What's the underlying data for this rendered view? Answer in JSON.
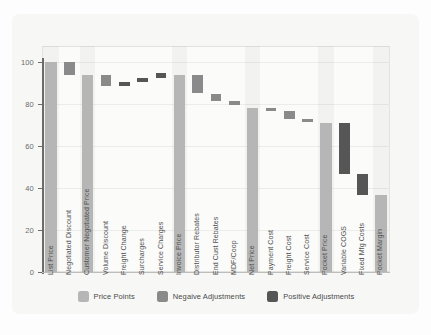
{
  "chart_data": {
    "type": "bar",
    "chart_subtype": "waterfall",
    "title": "",
    "xlabel": "",
    "ylabel": "",
    "ylim": [
      0,
      100
    ],
    "yticks": [
      0,
      20,
      40,
      60,
      80,
      100
    ],
    "grid": true,
    "legend_position": "bottom-center",
    "categories": [
      "List Price",
      "Negotiated Discount",
      "Customer Negotiated Price",
      "Volume Discount",
      "Freight Change",
      "Surcharges",
      "Service Charges",
      "Invoice Price",
      "Distributor Rebates",
      "End Cust Rebates",
      "MDF/Coop",
      "Net Price",
      "Payment Cost",
      "Freight Cost",
      "Service Cost",
      "Pocket Price",
      "Variable COGS",
      "Fixed Mfg Costs",
      "Pocket Margin"
    ],
    "bars": [
      {
        "label": "List Price",
        "kind": "total",
        "base": 0,
        "top": 100.0
      },
      {
        "label": "Negotiated Discount",
        "kind": "neg",
        "base": 94.0,
        "top": 100.0
      },
      {
        "label": "Customer Negotiated Price",
        "kind": "total",
        "base": 0,
        "top": 94.0
      },
      {
        "label": "Volume Discount",
        "kind": "neg",
        "base": 88.5,
        "top": 94.0
      },
      {
        "label": "Freight Change",
        "kind": "pos",
        "base": 88.5,
        "top": 90.5
      },
      {
        "label": "Surcharges",
        "kind": "pos",
        "base": 90.5,
        "top": 92.5
      },
      {
        "label": "Service Charges",
        "kind": "pos",
        "base": 92.5,
        "top": 95.0
      },
      {
        "label": "Invoice Price",
        "kind": "total",
        "base": 0,
        "top": 94.0
      },
      {
        "label": "Distributor Rebates",
        "kind": "neg",
        "base": 85.0,
        "top": 94.0
      },
      {
        "label": "End Cust Rebates",
        "kind": "neg",
        "base": 81.5,
        "top": 85.0
      },
      {
        "label": "MDF/Coop",
        "kind": "neg",
        "base": 79.5,
        "top": 81.5
      },
      {
        "label": "Net Price",
        "kind": "total",
        "base": 0,
        "top": 78.0
      },
      {
        "label": "Payment Cost",
        "kind": "neg",
        "base": 76.5,
        "top": 78.0
      },
      {
        "label": "Freight Cost",
        "kind": "neg",
        "base": 73.0,
        "top": 76.5
      },
      {
        "label": "Service Cost",
        "kind": "neg",
        "base": 71.5,
        "top": 73.0
      },
      {
        "label": "Pocket Price",
        "kind": "total",
        "base": 0,
        "top": 71.0
      },
      {
        "label": "Variable COGS",
        "kind": "pos",
        "base": 46.5,
        "top": 71.0
      },
      {
        "label": "Fixed Mfg Costs",
        "kind": "pos",
        "base": 36.5,
        "top": 46.5
      },
      {
        "label": "Pocket Margin",
        "kind": "total",
        "base": 0,
        "top": 36.5
      }
    ],
    "series": [
      {
        "name": "Price Points",
        "values": [
          100.0,
          null,
          94.0,
          null,
          null,
          null,
          null,
          94.0,
          null,
          null,
          null,
          78.0,
          null,
          null,
          null,
          71.0,
          null,
          null,
          36.5
        ]
      },
      {
        "name": "Negaive Adjustments",
        "values": [
          null,
          -6.0,
          null,
          -5.5,
          null,
          null,
          null,
          null,
          -9.0,
          -3.5,
          -2.0,
          null,
          -1.5,
          -3.5,
          -1.5,
          null,
          null,
          null,
          null
        ]
      },
      {
        "name": "Positive Adjustments",
        "values": [
          null,
          null,
          null,
          null,
          2.0,
          2.0,
          2.5,
          null,
          null,
          null,
          null,
          null,
          null,
          null,
          null,
          null,
          -24.5,
          -10.0,
          null
        ]
      }
    ],
    "legend": [
      {
        "label": "Price Points",
        "color": "#b6b6b6"
      },
      {
        "label": "Negaive Adjustments",
        "color": "#8a8a8a"
      },
      {
        "label": "Positive Adjustments",
        "color": "#565656"
      }
    ]
  },
  "colors": {
    "page_background": "#fdfdfd",
    "card_background": "#f7f7f5",
    "plot_background": "#fbfbfa",
    "plot_border": "#e3e3e0",
    "axis": "#6d6d6d",
    "gridline": "#ececea",
    "tick_text": "#6b6b6b",
    "category_text": "#4f4f4f",
    "total_bar": "#b6b6b6",
    "negative_bar": "#8a8a8a",
    "positive_bar": "#565656"
  }
}
